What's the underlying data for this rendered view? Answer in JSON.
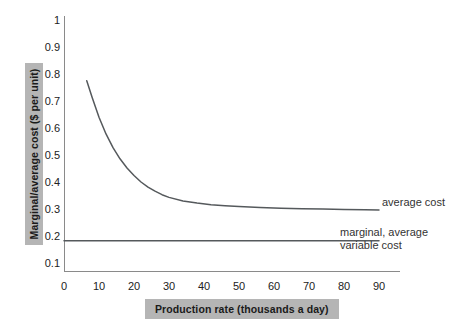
{
  "chart_data": {
    "type": "line",
    "title": "",
    "xlabel": "Production rate (thousands a day)",
    "ylabel": "Marginal/average cost ($ per unit)",
    "xlim": [
      0,
      96
    ],
    "ylim": [
      0.05,
      1.0
    ],
    "xticks": [
      0,
      10,
      20,
      30,
      40,
      50,
      60,
      70,
      80,
      90
    ],
    "yticks": [
      0.1,
      0.2,
      0.3,
      0.4,
      0.5,
      0.6,
      0.7,
      0.8,
      0.9,
      1
    ],
    "grid": false,
    "legend_position": "inline-annotations",
    "line_color": "#55595c",
    "series": [
      {
        "name": "average cost",
        "annotation": "average cost",
        "x": [
          6.5,
          8,
          10,
          12,
          14,
          16,
          18,
          20,
          22,
          24,
          26,
          28,
          30,
          34,
          38,
          42,
          46,
          50,
          56,
          62,
          68,
          74,
          80,
          86,
          90
        ],
        "y": [
          0.775,
          0.715,
          0.64,
          0.578,
          0.527,
          0.486,
          0.452,
          0.424,
          0.4,
          0.381,
          0.366,
          0.353,
          0.343,
          0.33,
          0.322,
          0.316,
          0.312,
          0.309,
          0.306,
          0.303,
          0.301,
          0.3,
          0.298,
          0.297,
          0.296
        ]
      },
      {
        "name": "marginal, average variable cost",
        "annotation_line1": "marginal, average",
        "annotation_line2": "variable cost",
        "x": [
          0,
          90
        ],
        "y": [
          0.182,
          0.182
        ],
        "constant_value": 0.182
      }
    ]
  },
  "axis": {
    "x_tick_labels": [
      "0",
      "10",
      "20",
      "30",
      "40",
      "50",
      "60",
      "70",
      "80",
      "90"
    ],
    "y_tick_labels": [
      "1",
      "0.9",
      "0.8",
      "0.7",
      "0.6",
      "0.5",
      "0.4",
      "0.3",
      "0.2",
      "0.1"
    ],
    "x_title": "Production rate (thousands a day)",
    "y_title": "Marginal/average cost ($ per unit)"
  },
  "annotations": {
    "average_cost": "average cost",
    "mavc_line1": "marginal, average",
    "mavc_line2": "variable cost"
  },
  "colors": {
    "curve": "#55595c",
    "axis": "#8a8a8a",
    "label_background": "#b5b5b5",
    "text": "#222222"
  }
}
